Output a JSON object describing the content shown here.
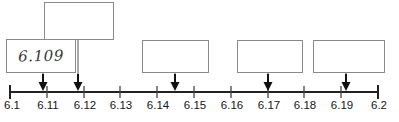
{
  "figure": {
    "colors": {
      "axis": "#222222",
      "box_border": "#8a8a8a",
      "handwriting": "#3a3a3a",
      "background": "#ffffff"
    }
  },
  "number_line": {
    "min": 6.1,
    "max": 6.2,
    "tick_step": 0.01,
    "tick_labels": [
      "6.1",
      "6.11",
      "6.12",
      "6.13",
      "6.14",
      "6.15",
      "6.16",
      "6.17",
      "6.18",
      "6.19",
      "6.2"
    ],
    "tick_values": [
      6.1,
      6.11,
      6.12,
      6.13,
      6.14,
      6.15,
      6.16,
      6.17,
      6.18,
      6.19,
      6.2
    ]
  },
  "markers": [
    {
      "id": "marker-1",
      "value": 6.109,
      "label": "arrow-marker-1"
    },
    {
      "id": "marker-2",
      "value": 6.1175,
      "label": "arrow-marker-2"
    },
    {
      "id": "marker-3",
      "value": 6.1448,
      "label": "arrow-marker-3"
    },
    {
      "id": "marker-4",
      "value": 6.1695,
      "label": "arrow-marker-4"
    },
    {
      "id": "marker-5",
      "value": 6.1905,
      "label": "arrow-marker-5"
    }
  ],
  "answer_boxes": [
    {
      "id": "box-1",
      "value": "6.109",
      "filled": true,
      "marker": "marker-1"
    },
    {
      "id": "box-2",
      "value": "",
      "filled": false,
      "marker": "marker-2"
    },
    {
      "id": "box-3",
      "value": "",
      "filled": false,
      "marker": "marker-3"
    },
    {
      "id": "box-4",
      "value": "",
      "filled": false,
      "marker": "marker-4"
    },
    {
      "id": "box-5",
      "value": "",
      "filled": false,
      "marker": "marker-5"
    }
  ]
}
